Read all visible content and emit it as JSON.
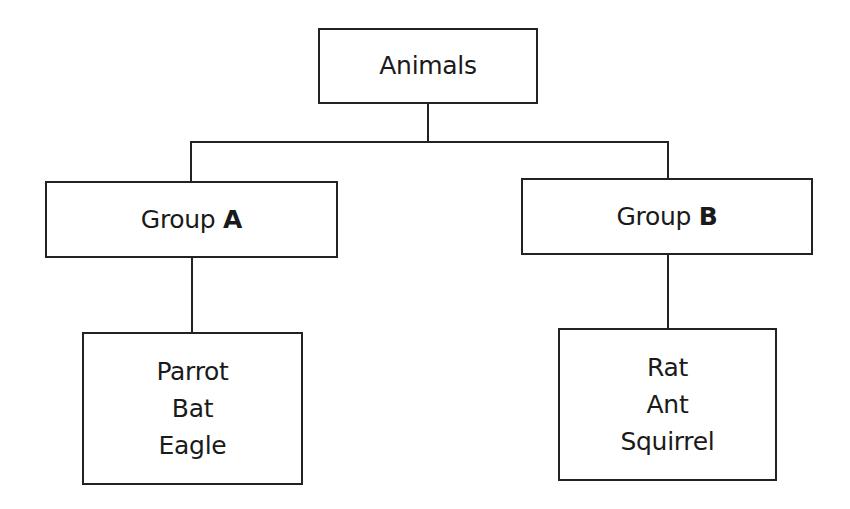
{
  "diagram": {
    "type": "tree",
    "root": {
      "label": "Animals"
    },
    "groups": [
      {
        "prefix": "Group",
        "letter": "A",
        "members": [
          "Parrot",
          "Bat",
          "Eagle"
        ]
      },
      {
        "prefix": "Group",
        "letter": "B",
        "members": [
          "Rat",
          "Ant",
          "Squirrel"
        ]
      }
    ],
    "colors": {
      "stroke": "#222222",
      "background": "#ffffff",
      "text": "#1a1a1a"
    }
  }
}
